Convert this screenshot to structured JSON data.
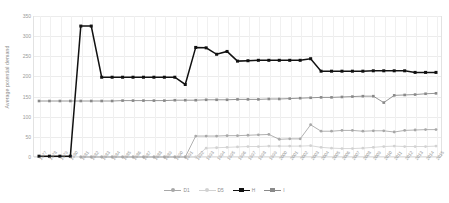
{
  "chart_data": {
    "type": "line",
    "title": "",
    "xlabel": "",
    "ylabel": "Average potential demand",
    "ylim": [
      0,
      350
    ],
    "yticks": [
      0,
      50,
      100,
      150,
      200,
      250,
      300,
      350
    ],
    "grid": true,
    "legend_position": "bottom",
    "categories": [
      "1977",
      "1978",
      "1979",
      "1980",
      "1981",
      "1982",
      "1983",
      "1984",
      "1985",
      "1986",
      "1987",
      "1988",
      "1989",
      "1990",
      "1991",
      "1992",
      "1993",
      "1994",
      "1995",
      "1996",
      "1997",
      "1998",
      "1999",
      "2000",
      "2001",
      "2002",
      "2003",
      "2004",
      "2005",
      "2006",
      "2007",
      "2008",
      "2009",
      "2010",
      "2011",
      "2012",
      "2013",
      "2014",
      "2015"
    ],
    "series": [
      {
        "name": "D1",
        "color": "#a8a8a8",
        "marker": "circle",
        "values": [
          null,
          null,
          null,
          null,
          0,
          0,
          0,
          0,
          0,
          0,
          0,
          0,
          0,
          0,
          0,
          52,
          52,
          52,
          53,
          53,
          54,
          55,
          56,
          44,
          45,
          45,
          80,
          64,
          64,
          66,
          66,
          64,
          65,
          65,
          62,
          66,
          67,
          68,
          68
        ]
      },
      {
        "name": "D5",
        "color": "#d2d2d2",
        "marker": "circle",
        "values": [
          null,
          null,
          null,
          null,
          0,
          0,
          0,
          0,
          0,
          0,
          0,
          0,
          0,
          0,
          0,
          0,
          22,
          23,
          24,
          25,
          26,
          26,
          27,
          27,
          27,
          27,
          28,
          24,
          22,
          21,
          21,
          22,
          24,
          26,
          27,
          26,
          26,
          26,
          27
        ]
      },
      {
        "name": "H",
        "color": "#111111",
        "marker": "square",
        "values": [
          2,
          2,
          2,
          2,
          325,
          325,
          198,
          198,
          198,
          198,
          198,
          198,
          198,
          198,
          180,
          272,
          271,
          255,
          262,
          238,
          239,
          240,
          240,
          240,
          240,
          240,
          244,
          213,
          213,
          213,
          213,
          213,
          214,
          214,
          214,
          214,
          210,
          210,
          210
        ]
      },
      {
        "name": "I",
        "color": "#8a8a8a",
        "marker": "square",
        "values": [
          139,
          139,
          139,
          139,
          139,
          139,
          139,
          139,
          140,
          140,
          140,
          140,
          140,
          141,
          141,
          141,
          142,
          142,
          142,
          143,
          143,
          143,
          144,
          144,
          145,
          146,
          147,
          148,
          148,
          149,
          150,
          151,
          151,
          135,
          153,
          154,
          155,
          157,
          158
        ]
      }
    ]
  },
  "legend": {
    "entries": [
      {
        "label": "D1"
      },
      {
        "label": "D5"
      },
      {
        "label": "H"
      },
      {
        "label": "I"
      }
    ]
  }
}
